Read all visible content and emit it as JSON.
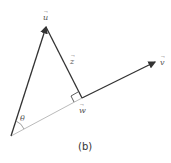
{
  "figure": {
    "caption": "(b)",
    "labels": {
      "u": "u",
      "v": "v",
      "w": "w",
      "z": "z",
      "theta": "θ"
    },
    "colors": {
      "main_line": "#333333",
      "projection_line": "#bbbbbb",
      "angle_arc": "#888888"
    }
  }
}
